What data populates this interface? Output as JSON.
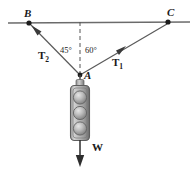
{
  "figure": {
    "points": {
      "B": {
        "label": "B",
        "x": 29,
        "y": 23
      },
      "C": {
        "label": "C",
        "x": 168,
        "y": 22
      },
      "A": {
        "label": "A",
        "x": 80,
        "y": 75
      }
    },
    "vectors": {
      "T1": {
        "label": "T",
        "subscript": "1",
        "from": "A",
        "to": "C"
      },
      "T2": {
        "label": "T",
        "subscript": "2",
        "from": "A",
        "to": "B"
      },
      "W": {
        "label": "W",
        "from": "A",
        "direction": "down"
      }
    },
    "angles": {
      "left": {
        "label": "45°",
        "value": 45,
        "between": "T2 and vertical dashed line"
      },
      "right": {
        "label": "60°",
        "value": 60,
        "between": "T1 and vertical dashed line"
      }
    },
    "elements": {
      "ceiling_line": "horizontal support line",
      "dashed_line": "vertical reference line through A",
      "traffic_light": "three-lamp traffic signal hanging from A"
    },
    "colors": {
      "stroke": "#3a3a3a",
      "line": "#555555",
      "text": "#1a1a1a",
      "lamp_light": "#d8d8d8",
      "lamp_dark": "#8f8f8f",
      "body": "#b5b5b5",
      "body_edge": "#6e6e6e"
    }
  }
}
